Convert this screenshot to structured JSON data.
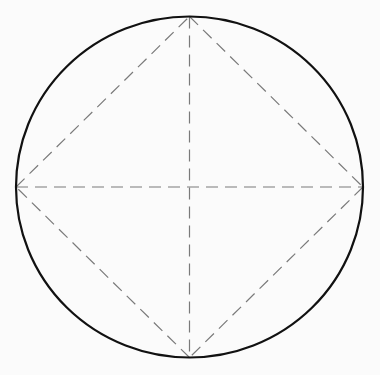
{
  "diagram": {
    "type": "circle-with-inscribed-square-and-diameters",
    "colors": {
      "background": "#fbfbfb",
      "circle_stroke": "#111111",
      "dashed_stroke": "#7a7a7a"
    },
    "circle": {
      "cx": 189.5,
      "cy": 187,
      "rx": 173.5,
      "ry": 170.5,
      "stroke_width": 2.2
    },
    "points": {
      "top": [
        189.5,
        16.5
      ],
      "right": [
        363,
        187
      ],
      "bottom": [
        189.5,
        357.5
      ],
      "left": [
        16,
        187
      ]
    },
    "dash_pattern": "12 7",
    "dashed_lines": [
      {
        "name": "vertical-diameter",
        "from": "top",
        "to": "bottom"
      },
      {
        "name": "horizontal-diameter",
        "from": "left",
        "to": "right"
      },
      {
        "name": "square-edge-top-right",
        "from": "top",
        "to": "right"
      },
      {
        "name": "square-edge-right-bottom",
        "from": "right",
        "to": "bottom"
      },
      {
        "name": "square-edge-bottom-left",
        "from": "bottom",
        "to": "left"
      },
      {
        "name": "square-edge-left-top",
        "from": "left",
        "to": "top"
      }
    ]
  }
}
